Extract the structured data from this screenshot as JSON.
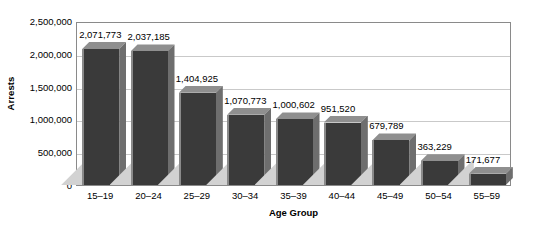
{
  "chart_data": {
    "type": "bar",
    "title": "",
    "xlabel": "Age Group",
    "ylabel": "Arrests",
    "categories": [
      "15–19",
      "20–24",
      "25–29",
      "30–34",
      "35–39",
      "40–44",
      "45–49",
      "50–54",
      "55–59"
    ],
    "values": [
      2071773,
      2037185,
      1404925,
      1070773,
      1000602,
      951520,
      679789,
      363229,
      171677
    ],
    "value_labels": [
      "2,071,773",
      "2,037,185",
      "1,404,925",
      "1,070,773",
      "1,000,602",
      "951,520",
      "679,789",
      "363,229",
      "171,677"
    ],
    "ylim": [
      0,
      2500000
    ],
    "ytick_values": [
      0,
      500000,
      1000000,
      1500000,
      2000000,
      2500000
    ],
    "ytick_labels": [
      "0",
      "500,000",
      "1,000,000",
      "1,500,000",
      "2,000,000",
      "2,500,000"
    ],
    "grid": true,
    "legend": "none",
    "style": "3d-bar",
    "colors": {
      "bar_face": "#3a3a3a",
      "bar_side": "#6e6e6e",
      "bar_top": "#8f8f8f",
      "bar_shadow": "#d2d2d2",
      "gridline": "#c9c9c9",
      "axis": "#8a8a8a",
      "background": "#ffffff",
      "text": "#000000"
    }
  }
}
